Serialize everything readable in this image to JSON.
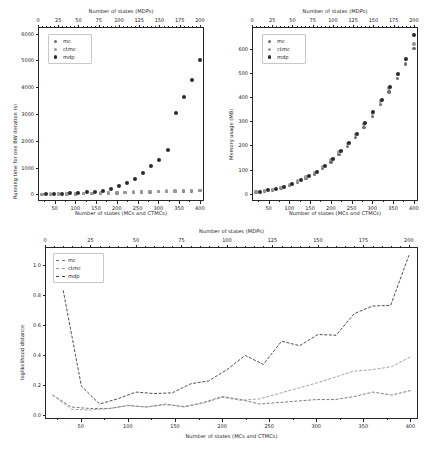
{
  "figure": {
    "width": 429,
    "height": 451,
    "background": "#ffffff"
  },
  "colors": {
    "mc": "#6e6e6e",
    "ctmc": "#9a9a9a",
    "mdp": "#2b2b2b",
    "axis": "#262626",
    "text": "#1a1a1a"
  },
  "panels": [
    {
      "id": "runtime",
      "name": "running-time-chart",
      "chart_index": 0
    },
    {
      "id": "memory",
      "name": "memory-usage-chart",
      "chart_index": 1
    },
    {
      "id": "distance",
      "name": "loglikelihood-distance-chart",
      "chart_index": 2
    }
  ],
  "chart_data": [
    {
      "type": "scatter",
      "title": "",
      "xlabel": "Number of states (MCs and CTMCs)",
      "xlabel_top": "Number of states (MDPs)",
      "ylabel": "Running time for one BW iteration (s)",
      "xlim": [
        10,
        410
      ],
      "xlim_top": [
        0,
        205
      ],
      "ylim": [
        -250,
        6250
      ],
      "xticks": [
        50,
        100,
        150,
        200,
        250,
        300,
        350,
        400
      ],
      "xticks_top": [
        0,
        25,
        50,
        75,
        100,
        125,
        150,
        175,
        200
      ],
      "yticks": [
        0,
        1000,
        2000,
        3000,
        4000,
        5000,
        6000
      ],
      "grid": false,
      "legend": [
        "mc",
        "ctmc",
        "mdp"
      ],
      "legend_position": "upper left",
      "legend_marker": "dot",
      "series": [
        {
          "name": "mc",
          "axis": "bottom",
          "x": [
            20,
            40,
            60,
            80,
            100,
            120,
            140,
            160,
            180,
            200,
            220,
            240,
            260,
            280,
            300,
            320,
            340,
            360,
            380,
            400
          ],
          "values": [
            2,
            4,
            7,
            11,
            16,
            22,
            29,
            37,
            46,
            55,
            63,
            72,
            80,
            88,
            96,
            104,
            112,
            120,
            127,
            134
          ]
        },
        {
          "name": "ctmc",
          "axis": "bottom",
          "x": [
            20,
            40,
            60,
            80,
            100,
            120,
            140,
            160,
            180,
            200,
            220,
            240,
            260,
            280,
            300,
            320,
            340,
            360,
            380,
            400
          ],
          "values": [
            3,
            5,
            9,
            14,
            20,
            27,
            35,
            44,
            54,
            64,
            73,
            83,
            92,
            101,
            110,
            118,
            126,
            134,
            141,
            148
          ]
        },
        {
          "name": "mdp",
          "axis": "top",
          "x": [
            10,
            20,
            30,
            40,
            50,
            60,
            70,
            80,
            90,
            100,
            110,
            120,
            130,
            140,
            150,
            160,
            170,
            180,
            190,
            200
          ],
          "values": [
            5,
            12,
            22,
            35,
            52,
            72,
            100,
            140,
            190,
            300,
            410,
            560,
            780,
            1040,
            1300,
            1640,
            2030,
            2520,
            3050,
            3620
          ]
        },
        {
          "name": "mdp-tail",
          "axis": "top",
          "x": [
            170,
            180,
            190,
            200
          ],
          "values": [
            3050,
            3620,
            4280,
            5000
          ]
        }
      ],
      "mdp_points_top": {
        "x": [
          10,
          20,
          30,
          40,
          50,
          60,
          70,
          80,
          90,
          100,
          110,
          120,
          130,
          140,
          150,
          160,
          170,
          180,
          190,
          200
        ],
        "y": [
          5,
          12,
          22,
          35,
          52,
          75,
          105,
          145,
          195,
          300,
          410,
          565,
          780,
          1040,
          1300,
          1640,
          2030,
          2520,
          3050,
          3620
        ]
      }
    },
    {
      "type": "scatter",
      "title": "",
      "xlabel": "Number of states (MCs and CTMCs)",
      "xlabel_top": "Number of states (MDPs)",
      "ylabel": "Memory usage (MB)",
      "xlim": [
        10,
        410
      ],
      "xlim_top": [
        0,
        205
      ],
      "ylim": [
        -30,
        690
      ],
      "xticks": [
        50,
        100,
        150,
        200,
        250,
        300,
        350,
        400
      ],
      "xticks_top": [
        0,
        25,
        50,
        75,
        100,
        125,
        150,
        175,
        200
      ],
      "yticks": [
        0,
        100,
        200,
        300,
        400,
        500,
        600
      ],
      "grid": false,
      "legend": [
        "mc",
        "ctmc",
        "mdp"
      ],
      "legend_position": "upper left",
      "legend_marker": "dot",
      "series": [
        {
          "name": "mc",
          "axis": "bottom",
          "x": [
            20,
            40,
            60,
            80,
            100,
            120,
            140,
            160,
            180,
            200,
            220,
            240,
            260,
            280,
            300,
            320,
            340,
            360,
            380,
            400
          ],
          "values": [
            8,
            11,
            16,
            24,
            34,
            47,
            63,
            82,
            105,
            132,
            162,
            196,
            234,
            275,
            320,
            369,
            421,
            477,
            537,
            600
          ]
        },
        {
          "name": "ctmc",
          "axis": "bottom",
          "x": [
            20,
            40,
            60,
            80,
            100,
            120,
            140,
            160,
            180,
            200,
            220,
            240,
            260,
            280,
            300,
            320,
            340,
            360,
            380,
            400
          ],
          "values": [
            9,
            13,
            18,
            27,
            38,
            52,
            69,
            89,
            113,
            141,
            172,
            207,
            246,
            288,
            334,
            384,
            437,
            494,
            555,
            620
          ]
        },
        {
          "name": "mdp",
          "axis": "top",
          "x": [
            10,
            20,
            30,
            40,
            50,
            60,
            70,
            80,
            90,
            100,
            110,
            120,
            130,
            140,
            150,
            160,
            170,
            180,
            190,
            200
          ],
          "values": [
            9,
            14,
            20,
            29,
            41,
            55,
            72,
            92,
            116,
            144,
            175,
            210,
            249,
            291,
            337,
            387,
            440,
            497,
            558,
            655
          ]
        }
      ]
    },
    {
      "type": "line",
      "title": "",
      "xlabel": "Number of states (MCs and CTMCs)",
      "xlabel_top": "Number of states (MDPs)",
      "ylabel": "loglikelihood distance",
      "xlim": [
        12,
        408
      ],
      "xlim_top": [
        0,
        205
      ],
      "ylim": [
        -0.03,
        1.12
      ],
      "xticks": [
        50,
        100,
        150,
        200,
        250,
        300,
        350,
        400
      ],
      "xticks_top": [
        0,
        25,
        50,
        75,
        100,
        125,
        150,
        175,
        200
      ],
      "yticks": [
        0.0,
        0.2,
        0.4,
        0.6,
        0.8,
        1.0
      ],
      "grid": false,
      "legend": [
        "mc",
        "ctmc",
        "mdp"
      ],
      "legend_position": "upper left",
      "legend_marker": "dashed-line",
      "x": [
        20,
        40,
        60,
        80,
        100,
        120,
        140,
        160,
        180,
        200,
        220,
        240,
        260,
        280,
        300,
        320,
        340,
        360,
        380,
        400
      ],
      "series": [
        {
          "name": "mc",
          "axis": "bottom",
          "values": [
            0.13,
            0.05,
            0.04,
            0.04,
            0.06,
            0.05,
            0.07,
            0.05,
            0.08,
            0.12,
            0.1,
            0.07,
            0.08,
            0.09,
            0.1,
            0.1,
            0.12,
            0.15,
            0.13,
            0.16
          ]
        },
        {
          "name": "ctmc",
          "axis": "bottom",
          "values": [
            0.13,
            0.035,
            0.03,
            0.04,
            0.06,
            0.05,
            0.065,
            0.055,
            0.075,
            0.115,
            0.095,
            0.105,
            0.14,
            0.175,
            0.21,
            0.25,
            0.29,
            0.3,
            0.32,
            0.385
          ]
        },
        {
          "name": "mdp",
          "axis": "top",
          "values": [
            0.83,
            0.19,
            0.07,
            0.105,
            0.15,
            0.14,
            0.145,
            0.205,
            0.225,
            0.3,
            0.395,
            0.335,
            0.49,
            0.46,
            0.535,
            0.53,
            0.675,
            0.725,
            0.73,
            1.065
          ]
        }
      ]
    }
  ],
  "labels": {
    "x_bottom": "Number of states (MCs and CTMCs)",
    "x_top": "Number of states (MDPs)",
    "y_runtime": "Running time for one BW iteration (s)",
    "y_memory": "Memory usage (MB)",
    "y_distance": "loglikelihood distance"
  }
}
